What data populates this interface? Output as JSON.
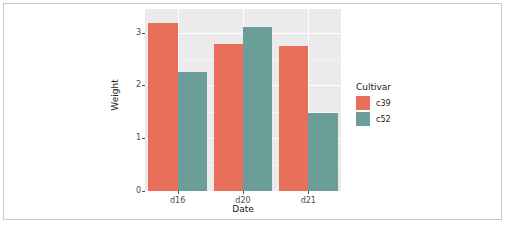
{
  "chart_data": {
    "type": "bar",
    "title": "",
    "subtitle": "",
    "xlabel": "Date",
    "ylabel": "Weight",
    "categories": [
      "d16",
      "d20",
      "d21"
    ],
    "series": [
      {
        "name": "c39",
        "color": "#E8705A",
        "values": [
          3.18,
          2.79,
          2.74
        ]
      },
      {
        "name": "c52",
        "color": "#6B9E99",
        "values": [
          2.26,
          3.1,
          1.47
        ]
      }
    ],
    "legend": {
      "title": "Cultivar",
      "position": "right",
      "entries": [
        "c39",
        "c52"
      ]
    },
    "yticks": [
      "0",
      "1",
      "2",
      "3"
    ],
    "ytick_values": [
      0,
      1,
      2,
      3
    ],
    "ylim": [
      0,
      3.45
    ],
    "grid": "horizontal-and-vertical-white-on-gray",
    "panel_background": "#EBEBEB",
    "figure_background": "#FFFFFF",
    "border_color": "#C8C8C8"
  }
}
